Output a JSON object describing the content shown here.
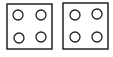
{
  "figure": {
    "stroke_color": "#222222",
    "background": "#ffffff",
    "boxes": [
      {
        "x": 7,
        "y": 4,
        "w": 45,
        "h": 45,
        "circles": [
          {
            "cx": 18,
            "cy": 15,
            "r": 5
          },
          {
            "cx": 41,
            "cy": 15,
            "r": 5
          },
          {
            "cx": 19,
            "cy": 38,
            "r": 5
          },
          {
            "cx": 41,
            "cy": 37,
            "r": 5
          }
        ]
      },
      {
        "x": 63,
        "y": 3,
        "w": 45,
        "h": 46,
        "circles": [
          {
            "cx": 75,
            "cy": 15,
            "r": 5
          },
          {
            "cx": 97,
            "cy": 14,
            "r": 5
          },
          {
            "cx": 75,
            "cy": 37,
            "r": 5
          },
          {
            "cx": 97,
            "cy": 37,
            "r": 5
          }
        ]
      }
    ]
  }
}
